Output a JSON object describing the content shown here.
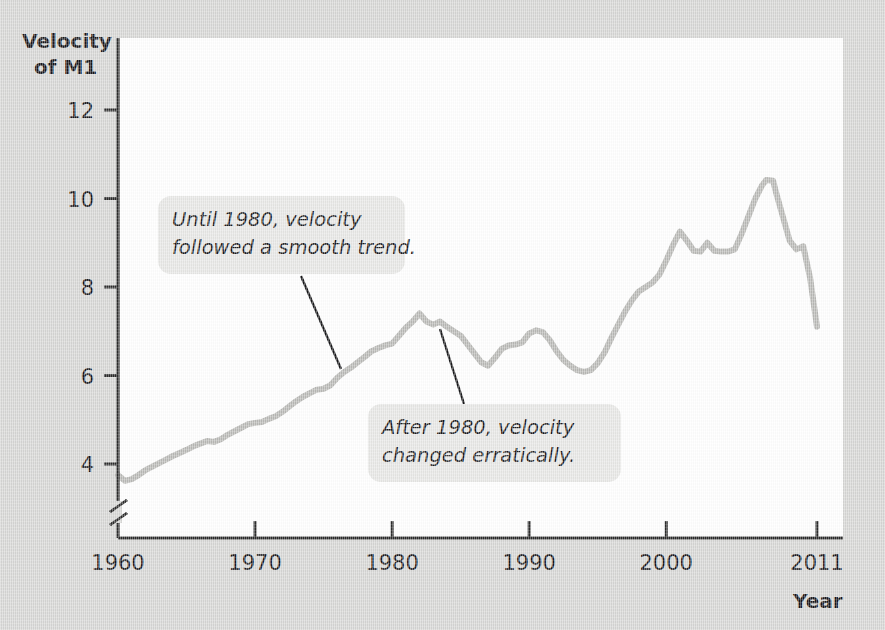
{
  "figure": {
    "background_color": "#d6d6d4",
    "plot_background_color": "#ffffff",
    "line_color": "#b9b9b6",
    "axis_color": "#2b2b2b",
    "annotation_box_color": "#e7e7e5",
    "ylabel_line1": "Velocity",
    "ylabel_line2": "of M1",
    "xlabel": "Year",
    "axis_break_marker": "axis-break-icon"
  },
  "annotations": [
    {
      "id": "annotation-smooth-trend",
      "line1": "Until 1980, velocity",
      "line2": "followed a smooth trend.",
      "points_to_year": 1976,
      "points_to_value": 6.05
    },
    {
      "id": "annotation-erratic",
      "line1": "After 1980, velocity",
      "line2": "changed erratically.",
      "points_to_year": 1983,
      "points_to_value": 7.0
    }
  ],
  "chart_data": {
    "type": "line",
    "title": "",
    "xlabel": "Year",
    "ylabel": "Velocity of M1",
    "xlim": [
      1960,
      2011
    ],
    "ylim": [
      3.2,
      12.6
    ],
    "grid": false,
    "legend": null,
    "y_ticks": [
      4,
      6,
      8,
      10,
      12
    ],
    "x_ticks": [
      1960,
      1970,
      1980,
      1990,
      2000,
      2011
    ],
    "x_tick_labels": [
      "1960",
      "1970",
      "1980",
      "1990",
      "2000",
      "2011"
    ],
    "y_axis_has_break": true,
    "series": [
      {
        "name": "Velocity of M1",
        "color": "#b9b9b6",
        "x": [
          1960,
          1960.5,
          1961,
          1961.5,
          1962,
          1962.5,
          1963,
          1963.5,
          1964,
          1964.5,
          1965,
          1965.5,
          1966,
          1966.5,
          1967,
          1967.5,
          1968,
          1968.5,
          1969,
          1969.5,
          1970,
          1970.5,
          1971,
          1971.5,
          1972,
          1972.5,
          1973,
          1973.5,
          1974,
          1974.5,
          1975,
          1975.5,
          1976,
          1976.5,
          1977,
          1977.5,
          1978,
          1978.5,
          1979,
          1979.5,
          1980,
          1980.5,
          1981,
          1981.5,
          1982,
          1982.5,
          1983,
          1983.5,
          1984,
          1984.5,
          1985,
          1985.5,
          1986,
          1986.5,
          1987,
          1987.5,
          1988,
          1988.5,
          1989,
          1989.5,
          1990,
          1990.5,
          1991,
          1991.5,
          1992,
          1992.5,
          1993,
          1993.5,
          1994,
          1994.5,
          1995,
          1995.5,
          1996,
          1996.5,
          1997,
          1997.5,
          1998,
          1998.5,
          1999,
          1999.5,
          2000,
          2000.5,
          2001,
          2001.5,
          2002,
          2002.5,
          2003,
          2003.5,
          2004,
          2004.5,
          2005,
          2005.5,
          2006,
          2006.5,
          2007,
          2007.3,
          2007.8,
          2008,
          2008.5,
          2009,
          2009.5,
          2010,
          2010.5,
          2011
        ],
        "y": [
          3.75,
          3.62,
          3.66,
          3.75,
          3.86,
          3.94,
          4.02,
          4.1,
          4.18,
          4.25,
          4.32,
          4.4,
          4.46,
          4.52,
          4.5,
          4.56,
          4.66,
          4.74,
          4.82,
          4.9,
          4.93,
          4.95,
          5.02,
          5.08,
          5.18,
          5.3,
          5.42,
          5.52,
          5.6,
          5.68,
          5.7,
          5.78,
          5.95,
          6.08,
          6.18,
          6.3,
          6.42,
          6.55,
          6.62,
          6.68,
          6.72,
          6.9,
          7.08,
          7.22,
          7.4,
          7.22,
          7.15,
          7.22,
          7.1,
          7.0,
          6.9,
          6.7,
          6.5,
          6.3,
          6.22,
          6.4,
          6.6,
          6.68,
          6.7,
          6.75,
          6.95,
          7.02,
          6.98,
          6.8,
          6.55,
          6.35,
          6.22,
          6.12,
          6.08,
          6.12,
          6.28,
          6.52,
          6.85,
          7.15,
          7.45,
          7.7,
          7.9,
          8.0,
          8.1,
          8.28,
          8.6,
          8.95,
          9.25,
          9.05,
          8.82,
          8.8,
          9.0,
          8.82,
          8.8,
          8.8,
          8.85,
          9.2,
          9.6,
          10.0,
          10.3,
          10.42,
          10.4,
          10.15,
          9.6,
          9.05,
          8.85,
          8.92,
          8.2,
          7.1
        ]
      }
    ]
  }
}
